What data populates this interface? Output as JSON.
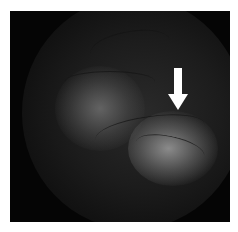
{
  "image": {
    "description": "Fundus angiography image with white arrow indicating hyperfluorescent lesion",
    "background_color": "#ffffff",
    "frame_color": "#050505",
    "arrow": {
      "color": "#ffffff",
      "direction": "down"
    }
  }
}
